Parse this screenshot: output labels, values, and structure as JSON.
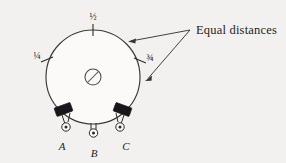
{
  "figure": {
    "background_color": "#f2f1ef",
    "ink_color": "#2b2a28"
  },
  "dial": {
    "center_x": 93,
    "center_y": 77,
    "radius": 47,
    "face_color": "#fbfaf8",
    "outline_color": "#3a3936"
  },
  "scale_marks": [
    {
      "id": "quarter",
      "label": "¼",
      "angle_deg": 180,
      "label_x": 37,
      "label_y": 59
    },
    {
      "id": "half",
      "label": "½",
      "angle_deg": 270,
      "label_x": 93,
      "label_y": 20
    },
    {
      "id": "three-quarter",
      "label": "¾",
      "angle_deg": 0,
      "label_x": 150,
      "label_y": 61
    }
  ],
  "center_screw": {
    "name": "slotted screw head",
    "radius": 8,
    "slot_angle_deg": 45
  },
  "terminals": [
    {
      "id": "A",
      "label": "A",
      "label_x": 62,
      "label_y": 150,
      "has_tab": true
    },
    {
      "id": "B",
      "label": "B",
      "label_x": 94,
      "label_y": 157,
      "has_tab": false
    },
    {
      "id": "C",
      "label": "C",
      "label_x": 126,
      "label_y": 150,
      "has_tab": true
    }
  ],
  "callout": {
    "text": "Equal distances",
    "text_x": 196,
    "text_y": 34,
    "anchor_x": 190,
    "anchor_y": 30,
    "arrows": [
      {
        "id": "upper",
        "tip_x": 128,
        "tip_y": 41
      },
      {
        "id": "lower",
        "tip_x": 145,
        "tip_y": 81
      }
    ]
  }
}
